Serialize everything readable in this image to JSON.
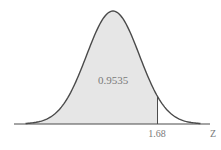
{
  "chart_data": {
    "type": "area",
    "title": "",
    "distribution": "standard normal",
    "shaded_region": {
      "from": "-inf",
      "to": 1.68,
      "area": 0.9535
    },
    "cutoff": 1.68,
    "area_label": "0.9535",
    "cutoff_label": "1.68",
    "xlabel": "Z",
    "ylabel": "",
    "xlim": [
      -3.5,
      3.5
    ],
    "grid": false,
    "legend": null
  },
  "colors": {
    "curve": "#4a4a4a",
    "shade": "#e6e6e6",
    "axis": "#4a4a4a",
    "text": "#7a7a7a"
  }
}
